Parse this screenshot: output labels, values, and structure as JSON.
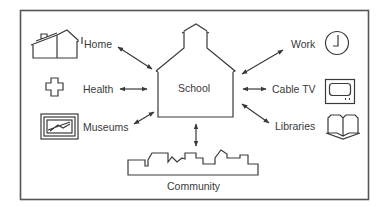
{
  "diagram": {
    "center": {
      "label": "School",
      "icon": "schoolhouse-icon"
    },
    "nodes": [
      {
        "id": "home",
        "label": "Home",
        "icon": "house-icon",
        "side": "left"
      },
      {
        "id": "health",
        "label": "Health",
        "icon": "cross-icon",
        "side": "left"
      },
      {
        "id": "museums",
        "label": "Museums",
        "icon": "framed-picture-icon",
        "side": "left"
      },
      {
        "id": "work",
        "label": "Work",
        "icon": "clock-icon",
        "side": "right"
      },
      {
        "id": "cabletv",
        "label": "Cable TV",
        "icon": "television-icon",
        "side": "right"
      },
      {
        "id": "libraries",
        "label": "Libraries",
        "icon": "open-book-icon",
        "side": "right"
      },
      {
        "id": "community",
        "label": "Community",
        "icon": "skyline-icon",
        "side": "bottom"
      }
    ],
    "connections": [
      {
        "from": "school",
        "to": "home",
        "type": "bidirectional"
      },
      {
        "from": "school",
        "to": "health",
        "type": "bidirectional"
      },
      {
        "from": "school",
        "to": "museums",
        "type": "bidirectional"
      },
      {
        "from": "school",
        "to": "work",
        "type": "bidirectional"
      },
      {
        "from": "school",
        "to": "cabletv",
        "type": "bidirectional"
      },
      {
        "from": "school",
        "to": "libraries",
        "type": "bidirectional"
      },
      {
        "from": "school",
        "to": "community",
        "type": "bidirectional"
      }
    ],
    "line_color": "#3a3a3a"
  }
}
